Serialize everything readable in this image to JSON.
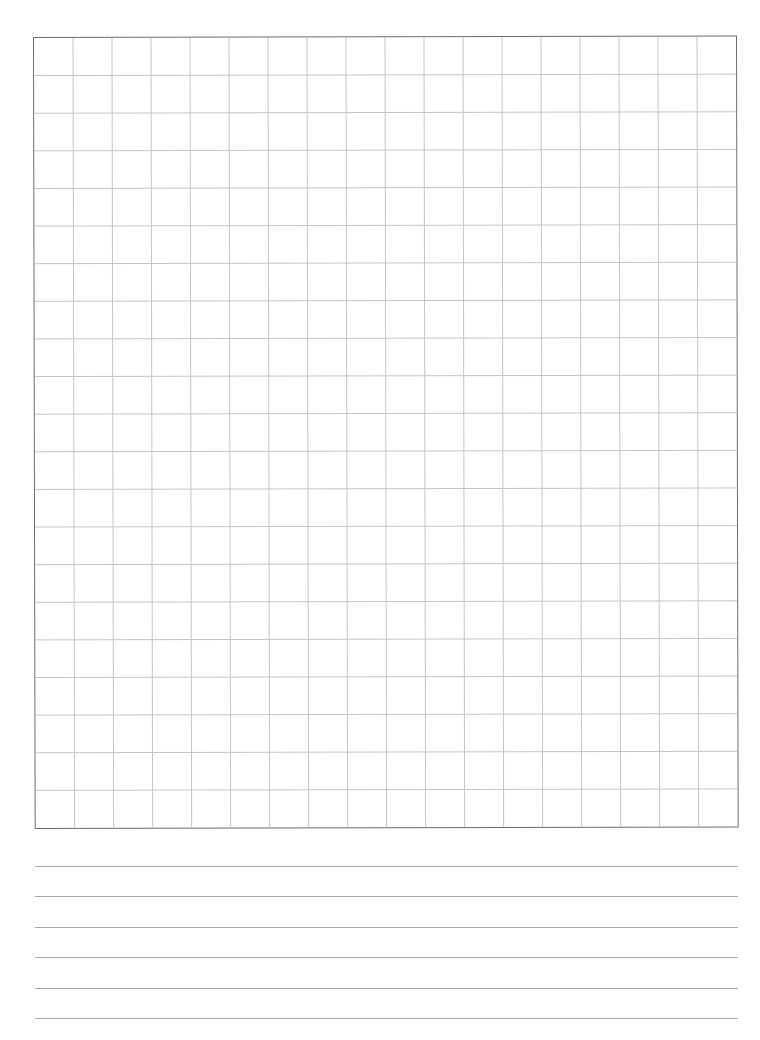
{
  "worksheet": {
    "type": "graph-paper-with-ruled-lines",
    "grid": {
      "columns": 18,
      "rows": 21,
      "line_color": "#c4c4c4",
      "border_color": "#6f6f6f"
    },
    "ruled_section": {
      "line_count": 6,
      "line_color": "#a9a9a9",
      "line_positions_px": [
        866,
        896,
        927,
        957,
        988,
        1018
      ]
    },
    "background_color": "#ffffff"
  }
}
